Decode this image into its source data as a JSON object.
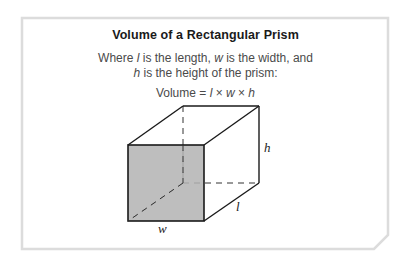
{
  "card": {
    "title": "Volume of a Rectangular Prism",
    "description_line1_parts": [
      "Where ",
      "l",
      " is the length, ",
      "w",
      " is the width, and"
    ],
    "description_line2_parts": [
      "h",
      " is the height of the prism:"
    ],
    "formula_parts": [
      "Volume = ",
      "l",
      " × ",
      "w",
      " × ",
      "h"
    ]
  },
  "figure": {
    "labels": {
      "height": "h",
      "length": "l",
      "width": "w"
    },
    "colors": {
      "front_face": "#b3b3b3",
      "edges": "#1a1a1a",
      "frame_border": "#dcdcdc"
    }
  }
}
